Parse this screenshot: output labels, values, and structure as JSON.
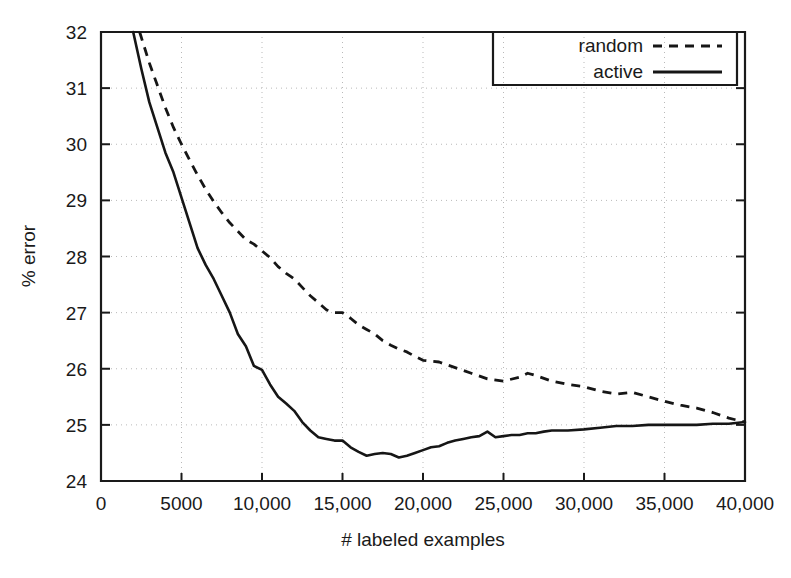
{
  "chart_data": {
    "type": "line",
    "title": "",
    "xlabel": "# labeled examples",
    "ylabel": "% error",
    "xlim": [
      0,
      40000
    ],
    "ylim": [
      24,
      32
    ],
    "grid": true,
    "legend_position": "top-right",
    "xticks": [
      0,
      5000,
      10000,
      15000,
      20000,
      25000,
      30000,
      35000,
      40000
    ],
    "xticklabels": [
      "0",
      "5000",
      "10,000",
      "15,000",
      "20,000",
      "25,000",
      "30,000",
      "35,000",
      "40,000"
    ],
    "yticks": [
      24,
      25,
      26,
      27,
      28,
      29,
      30,
      31,
      32
    ],
    "yticklabels": [
      "24",
      "25",
      "26",
      "27",
      "28",
      "29",
      "30",
      "31",
      "32"
    ],
    "series": [
      {
        "name": "random",
        "style": "dashed",
        "color": "#161616",
        "x": [
          2400,
          3000,
          3500,
          4000,
          4500,
          5000,
          5500,
          6000,
          6500,
          7000,
          7500,
          8000,
          8500,
          9000,
          9500,
          10000,
          10500,
          11000,
          11500,
          12000,
          12500,
          13000,
          13500,
          14000,
          14500,
          15000,
          15500,
          16000,
          16500,
          17000,
          17500,
          18000,
          18500,
          19000,
          19500,
          20000,
          21000,
          22000,
          23000,
          24000,
          25000,
          26000,
          26500,
          27000,
          28000,
          29000,
          30000,
          31000,
          32000,
          33000,
          34000,
          35000,
          36000,
          37000,
          38000,
          39000,
          40000
        ],
        "y": [
          32.0,
          31.45,
          31.05,
          30.65,
          30.3,
          30.0,
          29.72,
          29.45,
          29.2,
          28.98,
          28.78,
          28.6,
          28.45,
          28.3,
          28.22,
          28.1,
          27.98,
          27.82,
          27.7,
          27.6,
          27.45,
          27.3,
          27.18,
          27.05,
          27.0,
          27.0,
          26.9,
          26.78,
          26.7,
          26.62,
          26.5,
          26.42,
          26.35,
          26.3,
          26.22,
          26.15,
          26.12,
          26.02,
          25.92,
          25.82,
          25.78,
          25.85,
          25.92,
          25.88,
          25.78,
          25.72,
          25.68,
          25.6,
          25.55,
          25.58,
          25.5,
          25.42,
          25.35,
          25.3,
          25.22,
          25.12,
          25.05
        ]
      },
      {
        "name": "active",
        "style": "solid",
        "color": "#161616",
        "x": [
          2000,
          2500,
          3000,
          3500,
          4000,
          4500,
          5000,
          5500,
          6000,
          6500,
          7000,
          7500,
          8000,
          8500,
          9000,
          9500,
          10000,
          10500,
          11000,
          11500,
          12000,
          12500,
          13000,
          13500,
          14000,
          14500,
          15000,
          15500,
          16000,
          16500,
          17000,
          17500,
          18000,
          18500,
          19000,
          19500,
          20000,
          20500,
          21000,
          21500,
          22000,
          22500,
          23000,
          23500,
          24000,
          24500,
          25000,
          25500,
          26000,
          26500,
          27000,
          27500,
          28000,
          29000,
          30000,
          31000,
          32000,
          33000,
          34000,
          35000,
          36000,
          37000,
          38000,
          39000,
          40000
        ],
        "y": [
          32.0,
          31.35,
          30.75,
          30.3,
          29.85,
          29.5,
          29.05,
          28.6,
          28.15,
          27.85,
          27.6,
          27.3,
          27.0,
          26.62,
          26.4,
          26.05,
          25.98,
          25.72,
          25.5,
          25.38,
          25.25,
          25.05,
          24.9,
          24.78,
          24.75,
          24.72,
          24.72,
          24.6,
          24.52,
          24.45,
          24.48,
          24.5,
          24.48,
          24.42,
          24.45,
          24.5,
          24.55,
          24.6,
          24.62,
          24.68,
          24.72,
          24.75,
          24.78,
          24.8,
          24.88,
          24.78,
          24.8,
          24.82,
          24.82,
          24.85,
          24.85,
          24.88,
          24.9,
          24.9,
          24.92,
          24.95,
          24.98,
          24.98,
          25.0,
          25.0,
          25.0,
          25.0,
          25.02,
          25.02,
          25.05
        ]
      }
    ]
  },
  "legend": {
    "entries": [
      {
        "label": "random",
        "style": "dashed"
      },
      {
        "label": "active",
        "style": "solid"
      }
    ]
  },
  "labels": {
    "x_axis_title": "# labeled examples",
    "y_axis_title": "% error"
  }
}
